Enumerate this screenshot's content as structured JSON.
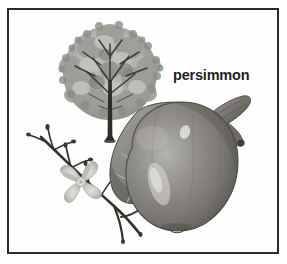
{
  "plate": {
    "kind": "botanical-illustration-plate",
    "label": "persimmon",
    "background_color": "#ffffff",
    "frame_color": "#2b2b2b",
    "palette": {
      "ink_dark": "#2b2b2b",
      "branch_dark": "#3a3734",
      "foliage_mid": "#9a9a95",
      "foliage_light": "#c2c2bd",
      "foliage_dark": "#6e6e69",
      "leaf_mid": "#8f908a",
      "leaf_dark": "#5d5e58",
      "fruit_mid": "#8e8d88",
      "fruit_dark": "#5a5a55",
      "fruit_light": "#c9c8c3",
      "stem_mid": "#7d7a74",
      "flower_light": "#cfcfca"
    },
    "subjects": [
      {
        "name": "tree",
        "description": "persimmon tree habit with dense rounded canopy and slender dark trunk"
      },
      {
        "name": "flowering-branch",
        "description": "twig with buds bearing a single four-lobed star-shaped flower"
      },
      {
        "name": "fruit",
        "description": "ripe persimmon fruit with attached calyx, woody stem and a large veined leaf"
      }
    ]
  }
}
